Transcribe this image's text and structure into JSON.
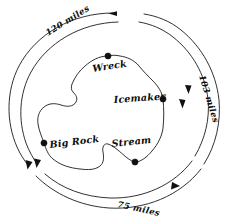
{
  "figure": {
    "type": "hand-drawn-island-map",
    "background_color": "#ffffff",
    "ink_color": "#111111",
    "width": 230,
    "height": 224
  },
  "landmarks": [
    {
      "id": "wreck",
      "label": "Wreck",
      "dot_x": 108,
      "dot_y": 56,
      "text_x": 93,
      "text_y": 72,
      "rotate": -9
    },
    {
      "id": "icemaker",
      "label": "Icemaker",
      "dot_x": 163,
      "dot_y": 99,
      "text_x": 122,
      "text_y": 103,
      "rotate": -4
    },
    {
      "id": "big-rock",
      "label": "Big Rock",
      "dot_x": 44,
      "dot_y": 143,
      "text_x": 50,
      "text_y": 148,
      "rotate": -7
    },
    {
      "id": "stream",
      "label": "Stream",
      "dot_x": 135,
      "dot_y": 162,
      "text_x": 116,
      "text_y": 146,
      "rotate": -6
    }
  ],
  "distances": [
    {
      "id": "distance-top",
      "label": "120 miles",
      "text_x": 50,
      "text_y": 35,
      "rotate": -32
    },
    {
      "id": "distance-right",
      "label": "103 miles",
      "text_x": 206,
      "text_y": 78,
      "rotate": 72
    },
    {
      "id": "distance-bottom",
      "label": "75 miles",
      "text_x": 120,
      "text_y": 206,
      "rotate": 12
    }
  ],
  "arcs": {
    "outer_label": "outer-range-arc",
    "inner_label": "inner-range-arc"
  }
}
